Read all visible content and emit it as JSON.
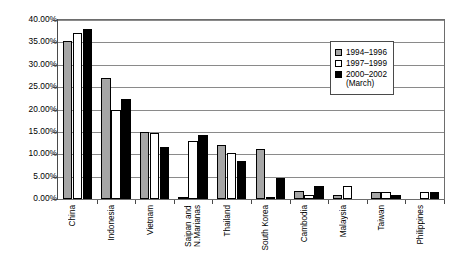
{
  "chart_data": {
    "type": "bar",
    "title": "",
    "xlabel": "",
    "ylabel": "",
    "ylim": [
      0,
      40
    ],
    "grid": true,
    "legend_position": "top-right",
    "y_tick_labels": [
      "40.00%",
      "35.00%",
      "30.00%",
      "25.00%",
      "20.00%",
      "15.00%",
      "10.00%",
      "5.00%",
      "0.00%"
    ],
    "y_tick_values": [
      40,
      35,
      30,
      25,
      20,
      15,
      10,
      5,
      0
    ],
    "categories": [
      "China",
      "Indonesia",
      "Vietnam",
      "Saipan and\nN.Marianas",
      "Thailand",
      "South Korea",
      "Cambodia",
      "Malaysia",
      "Taiwan",
      "Philippines"
    ],
    "series": [
      {
        "name": "1994–1996",
        "color": "#a6a6a6",
        "values": [
          35.3,
          27.0,
          14.9,
          0.2,
          12.0,
          11.1,
          1.8,
          0.9,
          1.5,
          0.1
        ]
      },
      {
        "name": "1997–1999",
        "color": "#ffffff",
        "values": [
          37.0,
          19.9,
          14.8,
          13.0,
          10.2,
          0.2,
          0.8,
          2.9,
          1.5,
          1.6
        ]
      },
      {
        "name": "2000–2002\n(March)",
        "color": "#000000",
        "values": [
          38.0,
          22.3,
          11.7,
          14.3,
          8.6,
          4.7,
          3.0,
          0.1,
          1.0,
          1.5
        ]
      }
    ]
  },
  "legend": {
    "items": [
      {
        "label": "1994–1996",
        "swatch": "gray"
      },
      {
        "label": "1997–1999",
        "swatch": "white"
      },
      {
        "label": "2000–2002\n(March)",
        "swatch": "black"
      }
    ]
  }
}
